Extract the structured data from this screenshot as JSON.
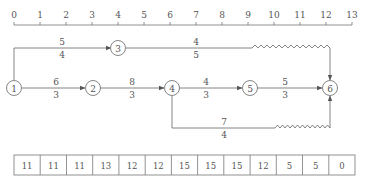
{
  "timescale": {
    "ticks": [
      "0",
      "1",
      "2",
      "3",
      "4",
      "5",
      "6",
      "7",
      "8",
      "9",
      "10",
      "11",
      "12",
      "13"
    ]
  },
  "nodes": [
    {
      "id": "1",
      "t": 0,
      "row": "mid"
    },
    {
      "id": "2",
      "t": 3,
      "row": "mid"
    },
    {
      "id": "3",
      "t": 4,
      "row": "top"
    },
    {
      "id": "4",
      "t": 6,
      "row": "mid"
    },
    {
      "id": "5",
      "t": 9,
      "row": "mid"
    },
    {
      "id": "6",
      "t": 12,
      "row": "mid"
    }
  ],
  "arrows": [
    {
      "from": "1",
      "to": "3",
      "top": "5",
      "bottom": "4"
    },
    {
      "from": "3",
      "to": "6",
      "top": "4",
      "bottom": "5",
      "free_float": "wavy"
    },
    {
      "from": "1",
      "to": "2",
      "top": "6",
      "bottom": "3"
    },
    {
      "from": "2",
      "to": "4",
      "top": "8",
      "bottom": "3"
    },
    {
      "from": "4",
      "to": "5",
      "top": "4",
      "bottom": "3"
    },
    {
      "from": "5",
      "to": "6",
      "top": "5",
      "bottom": "3"
    },
    {
      "from": "4",
      "to": "6",
      "top": "7",
      "bottom": "4",
      "free_float": "wavy"
    }
  ],
  "labels": {
    "a13_top": "5",
    "a13_bot": "4",
    "a36_top": "4",
    "a36_bot": "5",
    "a12_top": "6",
    "a12_bot": "3",
    "a24_top": "8",
    "a24_bot": "3",
    "a45_top": "4",
    "a45_bot": "3",
    "a56_top": "5",
    "a56_bot": "3",
    "a46_top": "7",
    "a46_bot": "4",
    "n1": "1",
    "n2": "2",
    "n3": "3",
    "n4": "4",
    "n5": "5",
    "n6": "6"
  },
  "resource_table": {
    "values": [
      "11",
      "11",
      "11",
      "13",
      "12",
      "12",
      "15",
      "15",
      "15",
      "12",
      "5",
      "5",
      "0"
    ]
  }
}
